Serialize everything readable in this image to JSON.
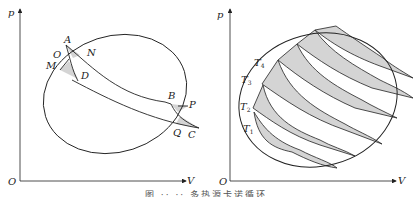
{
  "figure": {
    "caption": "图 ·· ·· 多热源卡诺循环",
    "colors": {
      "line": "#222222",
      "fill": "#d4d4d4",
      "background": "#ffffff"
    }
  },
  "left_panel": {
    "axes": {
      "y_label": "p",
      "x_label": "V",
      "origin_label": "O"
    },
    "points": {
      "A": "A",
      "N": "N",
      "O": "O",
      "M": "M",
      "D": "D",
      "B": "B",
      "P": "P",
      "Q": "Q",
      "C": "C"
    }
  },
  "right_panel": {
    "axes": {
      "y_label": "p",
      "x_label": "V",
      "origin_label": "O"
    },
    "isotherms": [
      {
        "base": "T",
        "sub": "1"
      },
      {
        "base": "T",
        "sub": "2"
      },
      {
        "base": "T",
        "sub": "3"
      },
      {
        "base": "T",
        "sub": "4"
      }
    ]
  }
}
